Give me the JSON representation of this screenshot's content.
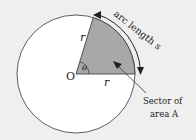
{
  "diagram": {
    "colors": {
      "background": "#efefef",
      "circle_fill": "#ffffff",
      "sector_fill": "#a8a8a8",
      "stroke": "#333333"
    },
    "labels": {
      "center": "O",
      "radius_slanted": "r",
      "radius_horizontal": "r",
      "angle": "θ",
      "arc": "arc length s",
      "sector_line1": "Sector of",
      "sector_line2": "area A"
    }
  }
}
